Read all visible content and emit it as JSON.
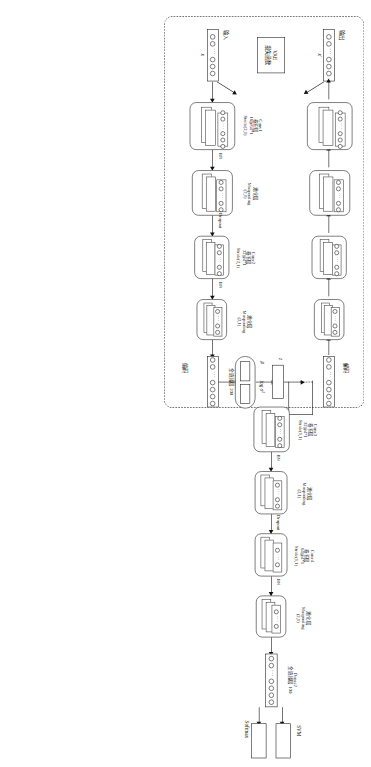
{
  "figure": {
    "regions": {
      "vae_label_encode": "编码",
      "vae_label_decode": "解码",
      "input_label": "输入",
      "output_label": "输出",
      "input_symbol": "x",
      "output_symbol": "x'",
      "loss_box_line1": "VAE",
      "loss_box_line2": "损失函数"
    },
    "latent": {
      "z_label": "z",
      "mu_label": "μ",
      "logvar_label": "log σ²"
    },
    "classifier_heads": {
      "svm": "SVM",
      "softmax": "Softmax"
    },
    "connector_labels": {
      "bn": "BN",
      "dropout": "Dropout"
    },
    "layers": [
      {
        "key": "conv1",
        "name": "Conv1",
        "cn_type": "卷积层",
        "spec": "16@64*1",
        "stride": "Stride(2,1)"
      },
      {
        "key": "pool1",
        "name": "",
        "cn_type": "池化层",
        "spec": "Maxpooling",
        "stride": "(2,1)"
      },
      {
        "key": "conv2",
        "name": "Conv2",
        "cn_type": "卷积层",
        "spec": "32@4*1",
        "stride": "Stride(2,1)"
      },
      {
        "key": "pool2",
        "name": "",
        "cn_type": "池化层",
        "spec": "Maxpooling",
        "stride": "(2,1)"
      },
      {
        "key": "dense1",
        "name": "Dense1",
        "cn_type": "全连接层",
        "spec": "200",
        "stride": ""
      },
      {
        "key": "conv3",
        "name": "Conv3",
        "cn_type": "卷积层",
        "spec": "32@4*1",
        "stride": "Stride(1,1)"
      },
      {
        "key": "pool3",
        "name": "",
        "cn_type": "池化层",
        "spec": "Maxpooling",
        "stride": "(2,1)"
      },
      {
        "key": "conv4",
        "name": "Conv4",
        "cn_type": "卷积层",
        "spec": "64@4*1",
        "stride": "Stride(1,1)"
      },
      {
        "key": "pool4",
        "name": "",
        "cn_type": "池化层",
        "spec": "Maxpooling",
        "stride": "(2,1)"
      },
      {
        "key": "dense2",
        "name": "Dense2",
        "cn_type": "全连接层",
        "spec": "100",
        "stride": ""
      }
    ],
    "colors": {
      "stroke": "#111111",
      "background": "#ffffff"
    }
  }
}
